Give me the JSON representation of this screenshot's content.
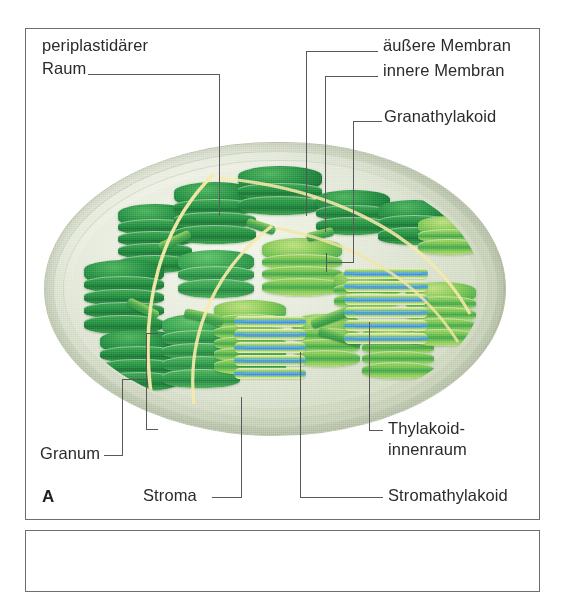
{
  "figure": {
    "letter": "A",
    "panel_border_color": "#6d6e71",
    "text_color": "#2b2b2b",
    "leader_color": "#58595b"
  },
  "labels": {
    "periplastidic_space": "periplastidärer\nRaum",
    "periplastidic_space_line1": "periplastidärer",
    "periplastidic_space_line2": "Raum",
    "outer_membrane": "äußere Membran",
    "inner_membrane": "innere Membran",
    "grana_thylakoid": "Granathylakoid",
    "thylakoid_lumen_line1": "Thylakoid-",
    "thylakoid_lumen_line2": "innenraum",
    "granum": "Granum",
    "stroma": "Stroma",
    "stroma_thylakoid": "Stromathylakoid"
  },
  "illustration": {
    "name": "chloroplast-cutaway",
    "colors": {
      "envelope_pale": "#d6ddc8",
      "envelope_edge": "#b3bfa3",
      "granum_dark_green": "#27793e",
      "granum_mid_green": "#3f9d46",
      "granum_light_green": "#9ccf5c",
      "thylakoid_lumen_blue": "#4a90c8",
      "membrane_yellow": "#f2e49a",
      "stroma_ground": "#dfe4d4"
    }
  }
}
